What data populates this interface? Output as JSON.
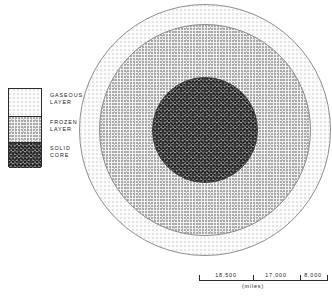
{
  "diagram": {
    "center": {
      "x": 205,
      "y": 130
    },
    "layers": [
      {
        "key": "gaseous",
        "name": "gaseous-layer",
        "label": "GASEOUS\nLAYER",
        "radius": 126,
        "fill": "#fbfbfb",
        "stroke": "#8e8e8e",
        "texture": "fine-stipple-light"
      },
      {
        "key": "frozen",
        "name": "frozen-layer",
        "label": "FROZEN\nLAYER",
        "radius": 106,
        "fill": "#f1f1f1",
        "stroke": "#8a8a8a",
        "texture": "stipple-medium"
      },
      {
        "key": "core",
        "name": "solid-core",
        "label": "SOLID\nCORE",
        "radius": 53,
        "fill": "#6f6f6f",
        "stroke": "#3d3d3d",
        "texture": "cross-hatch-dark"
      }
    ]
  },
  "legend": {
    "box": {
      "x": 8,
      "y": 88,
      "width": 34,
      "height": 79
    },
    "entries": [
      {
        "label": "GASEOUS\nLAYER",
        "texture": "fine-stipple-light",
        "swatch_height": 27
      },
      {
        "label": "FROZEN\nLAYER",
        "texture": "stipple-medium",
        "swatch_height": 26
      },
      {
        "label": "SOLID\nCORE",
        "texture": "cross-hatch-dark",
        "swatch_height": 26
      }
    ]
  },
  "scale": {
    "unit": "(miles)",
    "origin_x": 199,
    "y": 272,
    "ticks": [
      199,
      253,
      300,
      327
    ],
    "segments": [
      {
        "value": "18,500",
        "center_x": 226
      },
      {
        "value": "17,000",
        "center_x": 276
      },
      {
        "value": "8,000",
        "center_x": 313
      }
    ],
    "unit_center_x": 253
  }
}
